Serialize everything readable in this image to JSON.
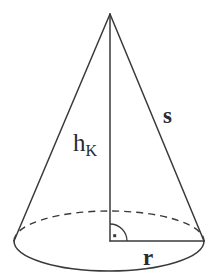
{
  "figure": {
    "type": "geometry-diagram",
    "shape": "cone",
    "background_color": "#ffffff",
    "stroke_color": "#3a3a3a",
    "label_color": "#2b2b2b"
  },
  "labels": {
    "height": {
      "base": "h",
      "subscript": "K",
      "full": "h_K",
      "meaning": "height-of-cone"
    },
    "slant": {
      "text": "s",
      "meaning": "slant-height"
    },
    "radius": {
      "text": "r",
      "meaning": "base-radius"
    }
  },
  "geometry": {
    "apex": {
      "x": 110,
      "y": 14
    },
    "base_center": {
      "x": 110,
      "y": 241
    },
    "base_left": {
      "x": 14,
      "y": 241
    },
    "base_right": {
      "x": 204,
      "y": 241
    },
    "base_ellipse": {
      "cx": 109,
      "cy": 241,
      "rx": 95,
      "ry": 30
    },
    "height_line": {
      "x1": 110,
      "y1": 14,
      "x2": 110,
      "y2": 241
    },
    "radius_line": {
      "x1": 110,
      "y1": 241,
      "x2": 204,
      "y2": 241
    },
    "right_angle_marker": {
      "x": 110,
      "y": 241,
      "size": 17
    },
    "back_arc_style": "dashed",
    "front_arc_style": "solid"
  }
}
